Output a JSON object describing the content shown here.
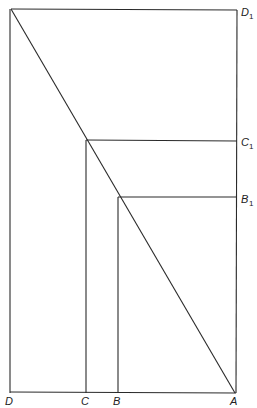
{
  "diagram": {
    "type": "geometric-construction",
    "frame": {
      "left": 10,
      "top": 9,
      "right": 237,
      "bottom": 393
    },
    "diagonal": {
      "from": [
        11,
        9
      ],
      "to": [
        235,
        393
      ]
    },
    "points": {
      "D": {
        "label": "D",
        "x": 10,
        "y": 393
      },
      "C": {
        "label": "C",
        "x": 86,
        "y": 393
      },
      "B": {
        "label": "B",
        "x": 118,
        "y": 393
      },
      "A": {
        "label": "A",
        "x": 235,
        "y": 393
      },
      "D1": {
        "label": "D",
        "sub": "1",
        "x": 237,
        "y": 10
      },
      "C1": {
        "label": "C",
        "sub": "1",
        "x": 237,
        "y": 140
      },
      "B1": {
        "label": "B",
        "sub": "1",
        "x": 237,
        "y": 197
      }
    },
    "stroke_color": "#2a2a2a",
    "background": "#ffffff"
  }
}
